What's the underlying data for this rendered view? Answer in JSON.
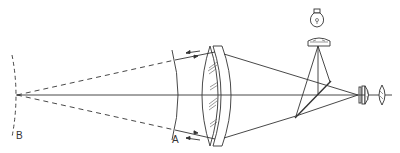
{
  "diagram": {
    "type": "optical-ray-diagram",
    "labels": {
      "point_a": "A",
      "point_b": "B"
    },
    "components": [
      {
        "id": "curved-surface-b",
        "label": "B",
        "style": "dashed-arc"
      },
      {
        "id": "curved-surface-a",
        "label": "A",
        "style": "solid-arc"
      },
      {
        "id": "objective-lens",
        "style": "doublet-lens"
      },
      {
        "id": "light-bulb",
        "style": "lamp-icon"
      },
      {
        "id": "condenser-lens",
        "style": "plano-convex"
      },
      {
        "id": "beam-splitter",
        "style": "diagonal-mirror"
      },
      {
        "id": "eyepiece-group",
        "style": "lens-elements"
      }
    ],
    "colors": {
      "line": "#333333",
      "background": "#ffffff"
    }
  }
}
